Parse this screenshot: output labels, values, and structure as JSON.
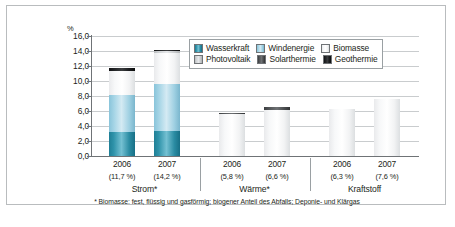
{
  "axis": {
    "unit": "%",
    "yticks": [
      "16,0",
      "14,0",
      "12,0",
      "10,0",
      "8,0",
      "6,0",
      "4,0",
      "2,0",
      "0,0"
    ]
  },
  "legend": {
    "row1": [
      {
        "label": "Wasserkraft",
        "color": "#3f9bb2",
        "key": "wasserkraft"
      },
      {
        "label": "Windenergie",
        "color": "#a9d6e7",
        "key": "windenergie"
      },
      {
        "label": "Biomasse",
        "color": "#ffffff",
        "key": "biomasse"
      }
    ],
    "row2": [
      {
        "label": "Photovoltaik",
        "color": "#d2d5d7",
        "key": "photovoltaik"
      },
      {
        "label": "Solarthermie",
        "color": "#55585a",
        "key": "solarthermie"
      },
      {
        "label": "Geothermie",
        "color": "#15171a",
        "key": "geothermie"
      }
    ]
  },
  "groups": [
    {
      "name": "Strom*",
      "bars": [
        {
          "year": "2006",
          "total": "(11,7 %)"
        },
        {
          "year": "2007",
          "total": "(14,2 %)"
        }
      ]
    },
    {
      "name": "Wärme*",
      "bars": [
        {
          "year": "2006",
          "total": "(5,8 %)"
        },
        {
          "year": "2007",
          "total": "(6,6 %)"
        }
      ]
    },
    {
      "name": "Kraftstoff",
      "bars": [
        {
          "year": "2006",
          "total": "(6,3 %)"
        },
        {
          "year": "2007",
          "total": "(7,6 %)"
        }
      ]
    }
  ],
  "footnote": "* Biomasse: fest, flüssig und gasförmig; biogener Anteil des Abfalls; Deponie- und Klärgas",
  "caption": "",
  "chart_data": {
    "type": "bar",
    "title": "",
    "subtitle": "",
    "xlabel": "",
    "ylabel": "%",
    "ylim": [
      0,
      16
    ],
    "yticks": [
      0,
      2,
      4,
      6,
      8,
      10,
      12,
      14,
      16
    ],
    "grid": true,
    "stacked": true,
    "legend_position": "inside-top-right",
    "categories": [
      "Strom* 2006",
      "Strom* 2007",
      "Wärme* 2006",
      "Wärme* 2007",
      "Kraftstoff 2006",
      "Kraftstoff 2007"
    ],
    "group_labels": [
      "Strom*",
      "Wärme*",
      "Kraftstoff"
    ],
    "totals": [
      11.7,
      14.2,
      5.8,
      6.6,
      6.3,
      7.6
    ],
    "total_labels": [
      "(11,7 %)",
      "(14,2 %)",
      "(5,8 %)",
      "(6,6 %)",
      "(6,3 %)",
      "(7,6 %)"
    ],
    "series": [
      {
        "name": "Wasserkraft",
        "color": "#3f9bb2",
        "values": [
          3.2,
          3.3,
          0.0,
          0.0,
          0.0,
          0.0
        ]
      },
      {
        "name": "Windenergie",
        "color": "#a9d6e7",
        "values": [
          4.9,
          6.3,
          0.0,
          0.0,
          0.0,
          0.0
        ]
      },
      {
        "name": "Biomasse",
        "color": "#ffffff",
        "values": [
          3.2,
          4.2,
          5.6,
          6.2,
          6.3,
          7.6
        ]
      },
      {
        "name": "Photovoltaik",
        "color": "#d2d5d7",
        "values": [
          0.1,
          0.2,
          0.0,
          0.0,
          0.0,
          0.0
        ]
      },
      {
        "name": "Solarthermie",
        "color": "#55585a",
        "values": [
          0.0,
          0.0,
          0.2,
          0.3,
          0.0,
          0.0
        ]
      },
      {
        "name": "Geothermie",
        "color": "#15171a",
        "values": [
          0.3,
          0.2,
          0.0,
          0.1,
          0.0,
          0.0
        ]
      }
    ],
    "annotations": [
      "* Biomasse: fest, flüssig und gasförmig; biogener Anteil des Abfalls; Deponie- und Klärgas"
    ]
  }
}
